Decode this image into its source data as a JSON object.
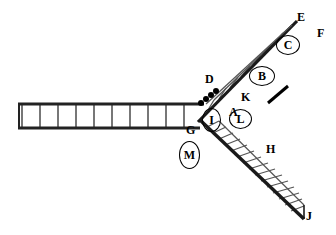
{
  "figure": {
    "background_color": "#ffffff",
    "stroke_color": "#1a1a1a",
    "rail_color": "#222222",
    "rung_color": "#555555",
    "label_color": "#000000",
    "width": 336,
    "height": 235
  },
  "labels": [
    {
      "id": "A",
      "text": "A",
      "style": "plain",
      "x": 229,
      "y": 112
    },
    {
      "id": "B",
      "text": "B",
      "style": "ringed",
      "x": 262,
      "y": 76,
      "rx": 13,
      "ry": 10
    },
    {
      "id": "C",
      "text": "C",
      "style": "ringed",
      "x": 288,
      "y": 45,
      "rx": 12,
      "ry": 10
    },
    {
      "id": "D",
      "text": "D",
      "style": "plain",
      "x": 205,
      "y": 79
    },
    {
      "id": "E",
      "text": "E",
      "style": "plain",
      "x": 297,
      "y": 17
    },
    {
      "id": "F",
      "text": "F",
      "style": "plain",
      "x": 317,
      "y": 33
    },
    {
      "id": "G",
      "text": "G",
      "style": "plain",
      "x": 186,
      "y": 130
    },
    {
      "id": "H",
      "text": "H",
      "style": "plain",
      "x": 266,
      "y": 149
    },
    {
      "id": "I",
      "text": "I",
      "style": "ringed",
      "x": 211,
      "y": 120,
      "rx": 10,
      "ry": 12
    },
    {
      "id": "J",
      "text": "J",
      "style": "plain",
      "x": 306,
      "y": 216
    },
    {
      "id": "K",
      "text": "K",
      "style": "plain",
      "x": 241,
      "y": 97
    },
    {
      "id": "L",
      "text": "L",
      "style": "ringed",
      "x": 240,
      "y": 119,
      "rx": 12,
      "ry": 10
    },
    {
      "id": "M",
      "text": "M",
      "style": "ringed",
      "x": 189,
      "y": 155,
      "rx": 11,
      "ry": 14
    }
  ],
  "tracks": [
    {
      "name": "horizontal-track",
      "rail_near": {
        "x1": 18,
        "y1": 104,
        "x2": 203,
        "y2": 104
      },
      "rail_far": {
        "x1": 18,
        "y1": 128,
        "x2": 203,
        "y2": 128
      },
      "rung_count": 11
    },
    {
      "name": "upper-right-track",
      "rail_near": {
        "x1": 199,
        "y1": 120,
        "x2": 296,
        "y2": 21
      },
      "rail_far": {
        "x1": 205,
        "y1": 104,
        "x2": 282,
        "y2": 24
      },
      "rung_count": 9
    },
    {
      "name": "lower-right-track",
      "rail_near": {
        "x1": 200,
        "y1": 120,
        "x2": 303,
        "y2": 218
      },
      "rail_far": {
        "x1": 219,
        "y1": 120,
        "x2": 303,
        "y2": 203
      },
      "rung_count": 16
    }
  ],
  "markers": {
    "dots": [
      {
        "x": 201,
        "y": 103
      },
      {
        "x": 206,
        "y": 99
      },
      {
        "x": 211,
        "y": 95
      },
      {
        "x": 216,
        "y": 91
      }
    ],
    "dot_radius": 3,
    "scale_bar": {
      "x1": 268,
      "y1": 103,
      "x2": 288,
      "y2": 86,
      "thickness": 3
    }
  }
}
